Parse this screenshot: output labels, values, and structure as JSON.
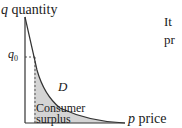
{
  "diagram": {
    "y_axis": {
      "variable": "q",
      "label": "quantity"
    },
    "x_axis": {
      "variable": "p",
      "label": "price"
    },
    "marker": {
      "symbol": "q",
      "subscript": "0"
    },
    "curve_label": "D",
    "region_label_line1": "Consumer",
    "region_label_line2": "surplus",
    "side_text": [
      "It",
      "pr"
    ]
  },
  "colors": {
    "shade": "#d0d0d0",
    "axis": "#333333"
  }
}
